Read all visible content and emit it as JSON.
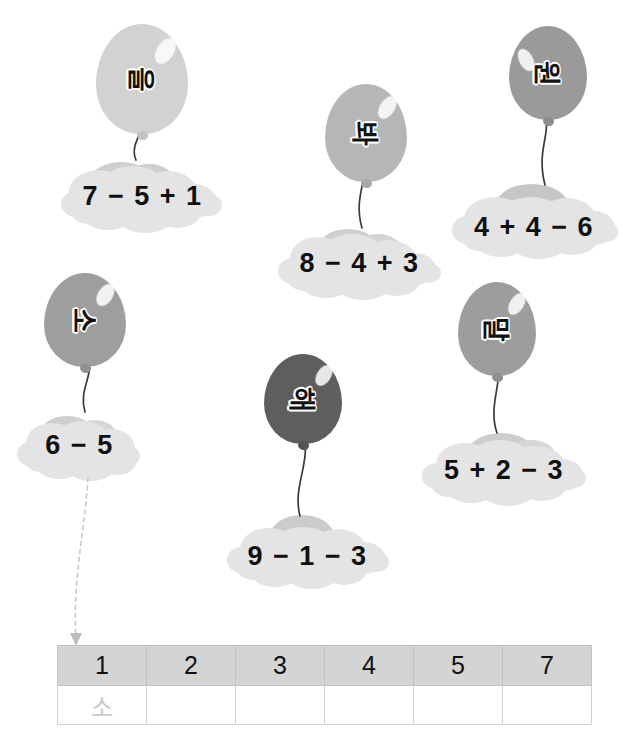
{
  "worksheet": {
    "title": "Balloon and cloud calculation matching worksheet",
    "balloons": [
      {
        "id": "b1",
        "syllable": "을",
        "color": "#d2d2d2",
        "equation": "7 − 5 + 1",
        "answer": 3
      },
      {
        "id": "b2",
        "syllable": "봐",
        "color": "#b6b6b6",
        "equation": "8 − 4 + 3",
        "answer": 7
      },
      {
        "id": "b3",
        "syllable": "원",
        "color": "#9a9a9a",
        "equation": "4 + 4 − 6",
        "answer": 2
      },
      {
        "id": "b4",
        "syllable": "소",
        "color": "#9e9e9e",
        "equation": "6 − 5",
        "answer": 1
      },
      {
        "id": "b5",
        "syllable": "해",
        "color": "#5e5e5e",
        "equation": "9 − 1 − 3",
        "answer": 5
      },
      {
        "id": "b6",
        "syllable": "말",
        "color": "#9d9d9d",
        "equation": "5 + 2 − 3",
        "answer": 4
      }
    ],
    "equations": {
      "eq1": "7 − 5 + 1",
      "eq2": "8 − 4 + 3",
      "eq3": "4 + 4 − 6",
      "eq4": "6 − 5",
      "eq5": "9 − 1 − 3",
      "eq6": "5 + 2 − 3"
    },
    "syllables": {
      "s1": "을",
      "s2": "봐",
      "s3": "원",
      "s4": "소",
      "s5": "해",
      "s6": "말"
    },
    "table": {
      "headers": [
        "1",
        "2",
        "3",
        "4",
        "5",
        "7"
      ],
      "answers": [
        "소",
        "",
        "",
        "",
        "",
        ""
      ]
    },
    "colors": {
      "header_fill": "#d4d4d4",
      "table_border": "#d2d2d2",
      "cloud_fill": "#e3e3e3",
      "cloud_shade": "#c9c9c9",
      "string": "#2f2f2f",
      "arrow": "#cccccc",
      "prefilled_text": "#c9c9c9"
    }
  }
}
